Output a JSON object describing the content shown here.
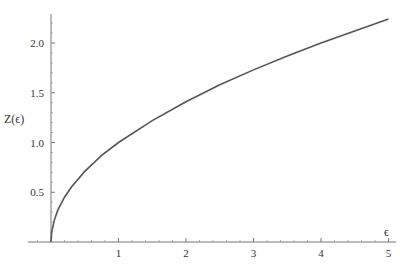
{
  "chart_data": {
    "type": "line",
    "title": "",
    "xlabel": "ϵ",
    "ylabel": "Z(ϵ)",
    "xlim": [
      0,
      5.1
    ],
    "ylim": [
      0,
      2.3
    ],
    "x_ticks": [
      "1",
      "2",
      "3",
      "4",
      "5"
    ],
    "y_ticks": [
      "0.5",
      "1.0",
      "1.5",
      "2.0"
    ],
    "grid": false,
    "legend": null,
    "series": [
      {
        "name": "Z(ϵ)",
        "color": "#555555",
        "x": [
          0,
          0.01,
          0.05,
          0.1,
          0.2,
          0.3,
          0.5,
          0.75,
          1,
          1.5,
          2,
          2.5,
          3,
          3.5,
          4,
          4.5,
          5
        ],
        "y": [
          0,
          0.1,
          0.22,
          0.32,
          0.45,
          0.55,
          0.71,
          0.87,
          1.0,
          1.22,
          1.41,
          1.58,
          1.73,
          1.87,
          2.0,
          2.12,
          2.24
        ]
      }
    ]
  },
  "axes": {
    "x_label": "ϵ",
    "y_label": "Z(ϵ)"
  }
}
